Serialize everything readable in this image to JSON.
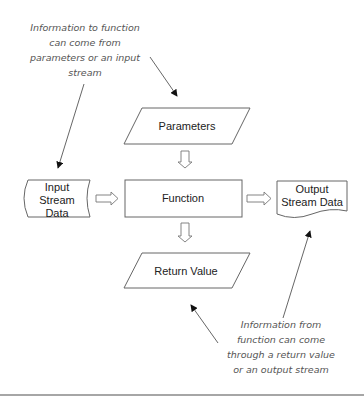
{
  "diagram": {
    "notes": {
      "top": [
        "Information to function",
        "can come from",
        "parameters or an input",
        "stream"
      ],
      "bottom": [
        "Information from",
        "function can come",
        "through a return value",
        "or an output stream"
      ]
    },
    "nodes": {
      "parameters": "Parameters",
      "function": "Function",
      "return_value": "Return Value",
      "input_stream": [
        "Input",
        "Stream",
        "Data"
      ],
      "output_stream": [
        "Output",
        "Stream Data"
      ]
    },
    "colors": {
      "stroke": "#666666",
      "text": "#222222",
      "note_text": "#555555",
      "background": "#ffffff"
    }
  }
}
